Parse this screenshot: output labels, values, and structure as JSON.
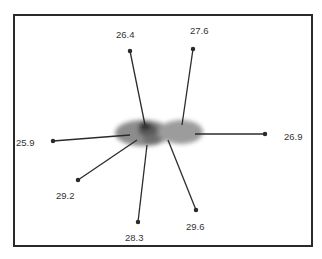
{
  "figure": {
    "frame_color": "#2a2a2a",
    "line_color": "#2b2b2b",
    "blob_color": "#8a8a8a",
    "labels": [
      {
        "id": "top-left",
        "value": "26.4"
      },
      {
        "id": "top-right",
        "value": "27.6"
      },
      {
        "id": "left",
        "value": "25.9"
      },
      {
        "id": "right",
        "value": "26.9"
      },
      {
        "id": "lower-left",
        "value": "29.2"
      },
      {
        "id": "bottom",
        "value": "28.3"
      },
      {
        "id": "lower-right",
        "value": "29.6"
      }
    ]
  }
}
